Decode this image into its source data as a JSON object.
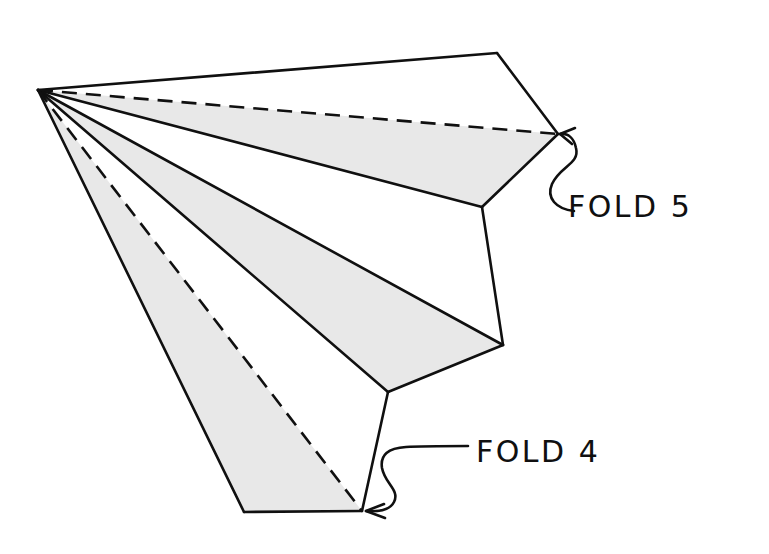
{
  "diagram": {
    "background_color": "#ffffff",
    "stroke_color": "#101010",
    "shade_color": "#e8e8e8",
    "stroke_width": 2.6,
    "apex": {
      "x": 38,
      "y": 90
    },
    "vertices": {
      "apex": {
        "x": 38,
        "y": 90
      },
      "top": {
        "x": 497,
        "y": 53
      },
      "fold5_point": {
        "x": 558,
        "y": 134
      },
      "mid_upper": {
        "x": 482,
        "y": 207
      },
      "mid_lower": {
        "x": 503,
        "y": 345
      },
      "low_inner": {
        "x": 388,
        "y": 392
      },
      "fold4_point": {
        "x": 362,
        "y": 511
      },
      "bottom_left": {
        "x": 244,
        "y": 512
      }
    },
    "facets": [
      {
        "name": "facet-top-white",
        "shaded": false,
        "points": "38,90 497,53 558,134"
      },
      {
        "name": "facet-upper-shaded",
        "shaded": true,
        "points": "38,90 558,134 482,207"
      },
      {
        "name": "facet-middle-white",
        "shaded": false,
        "points": "38,90 482,207 503,345"
      },
      {
        "name": "facet-lower-shaded",
        "shaded": true,
        "points": "38,90 503,345 388,392"
      },
      {
        "name": "facet-bottom-white",
        "shaded": false,
        "points": "38,90 388,392 362,511"
      },
      {
        "name": "facet-bottom-shaded",
        "shaded": true,
        "points": "38,90 362,511 244,512"
      }
    ],
    "solid_edges": [
      {
        "name": "edge-apex-to-top",
        "d": "M38,90 L497,53"
      },
      {
        "name": "edge-top-to-fold5",
        "d": "M497,53 L558,134"
      },
      {
        "name": "edge-fold5-to-midupper",
        "d": "M558,134 L482,207"
      },
      {
        "name": "edge-apex-to-midupper",
        "d": "M38,90 L482,207"
      },
      {
        "name": "edge-midupper-to-midlow",
        "d": "M482,207 L503,345"
      },
      {
        "name": "edge-apex-to-midlow",
        "d": "M38,90 L503,345"
      },
      {
        "name": "edge-midlow-to-lowinner",
        "d": "M503,345 L388,392"
      },
      {
        "name": "edge-apex-to-lowinner",
        "d": "M38,90 L388,392"
      },
      {
        "name": "edge-lowinner-to-fold4",
        "d": "M388,392 L362,511"
      },
      {
        "name": "edge-apex-to-bottomleft",
        "d": "M38,90 L244,512"
      },
      {
        "name": "edge-bottom",
        "d": "M244,512 L362,511"
      }
    ],
    "dashed_edges": [
      {
        "name": "crease-apex-to-fold5",
        "d": "M38,90 L558,134"
      },
      {
        "name": "crease-apex-to-fold4",
        "d": "M38,90 L362,511"
      }
    ],
    "dash_pattern": "15 9"
  },
  "annotations": [
    {
      "id": "fold-5",
      "label": "FOLD 5",
      "text_x": 568,
      "text_y": 217,
      "leader_path": "M574,211 C556,209 546,198 552,184 C560,166 580,164 576,148 C574,138 568,133 560,134",
      "arrow_path": "M560,134 L575,128 M560,134 L572,144",
      "target": {
        "x": 558,
        "y": 134
      }
    },
    {
      "id": "fold-4",
      "label": "FOLD 4",
      "text_x": 476,
      "text_y": 462,
      "leader_path": "M468,446 C440,446 420,446 406,447 C388,448 380,455 382,468 C385,484 400,490 394,502 C390,510 380,512 366,511",
      "arrow_path": "M366,511 L384,504 M366,511 L385,518",
      "target": {
        "x": 362,
        "y": 511
      }
    }
  ]
}
